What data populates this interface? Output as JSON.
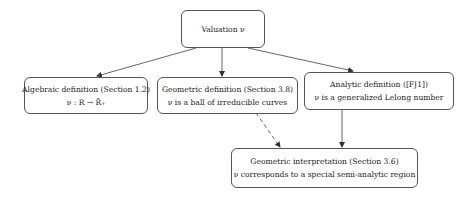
{
  "diagram": {
    "nodes": {
      "root": {
        "lines": [
          "Valuation ν"
        ]
      },
      "algebraic": {
        "lines": [
          "Algebraic definition (Section 1.2)",
          "ν : R → R̄₊"
        ]
      },
      "geometric": {
        "lines": [
          "Geometric definition (Section 3.8)",
          "ν is a ball of irreducible curves"
        ]
      },
      "analytic": {
        "lines": [
          "Analytic definition ([FJ1])",
          "ν is a generalized Lelong number"
        ]
      },
      "interpretation": {
        "lines": [
          "Geometric interpretation (Section 3.6)",
          "ν corresponds to a special semi-analytic region"
        ]
      }
    },
    "edges": [
      {
        "from": "root",
        "to": "algebraic",
        "style": "solid"
      },
      {
        "from": "root",
        "to": "geometric",
        "style": "solid"
      },
      {
        "from": "root",
        "to": "analytic",
        "style": "solid"
      },
      {
        "from": "geometric",
        "to": "interpretation",
        "style": "dashed"
      },
      {
        "from": "analytic",
        "to": "interpretation",
        "style": "solid"
      }
    ],
    "colors": {
      "stroke": "#555555",
      "text": "#222222",
      "background": "#ffffff"
    }
  }
}
